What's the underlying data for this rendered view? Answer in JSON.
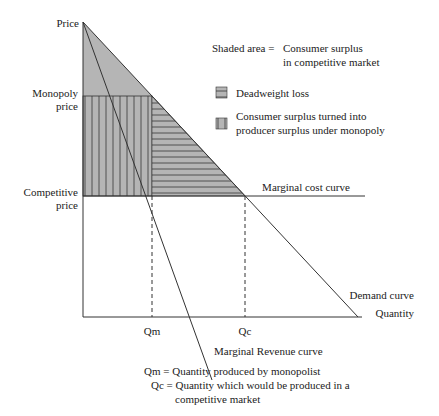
{
  "diagram": {
    "axes": {
      "y_label": "Price",
      "x_label": "Quantity"
    },
    "price_labels": {
      "monopoly": [
        "Monopoly",
        "price"
      ],
      "competitive": [
        "Competitive",
        "price"
      ]
    },
    "quantity_labels": {
      "qm": "Qm",
      "qc": "Qc"
    },
    "curve_labels": {
      "marginal_cost": "Marginal cost curve",
      "demand": "Demand curve",
      "marginal_revenue": "Marginal Revenue curve"
    },
    "legend": {
      "shaded_prefix": "Shaded area =",
      "shaded_line1": "Consumer surplus",
      "shaded_line2": "in competitive market",
      "deadweight": "Deadweight loss",
      "transfer_line1": "Consumer surplus turned into",
      "transfer_line2": "producer surplus under monopoly"
    },
    "footnotes": {
      "qm_def": "Qm = Quantity produced by monopolist",
      "qc_def_line1": "Qc = Quantity which would be produced in a",
      "qc_def_line2": "competitive market"
    },
    "colors": {
      "shade": "#b5b5b5",
      "line": "#333333",
      "hatch": "#555555"
    }
  }
}
